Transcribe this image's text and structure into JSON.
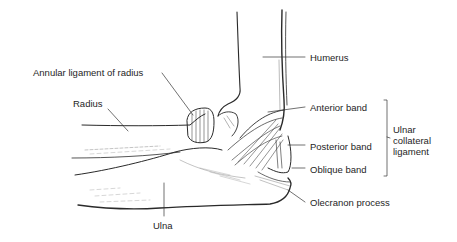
{
  "diagram": {
    "labels": {
      "humerus": "Humerus",
      "annular_ligament": "Annular ligament of radius",
      "radius": "Radius",
      "anterior_band": "Anterior band",
      "posterior_band": "Posterior band",
      "oblique_band": "Oblique band",
      "ucl_line1": "Ulnar",
      "ucl_line2": "collateral",
      "ucl_line3": "ligament",
      "olecranon": "Olecranon process",
      "ulna": "Ulna"
    },
    "colors": {
      "ink": "#1e1e1e",
      "background": "#ffffff"
    }
  }
}
